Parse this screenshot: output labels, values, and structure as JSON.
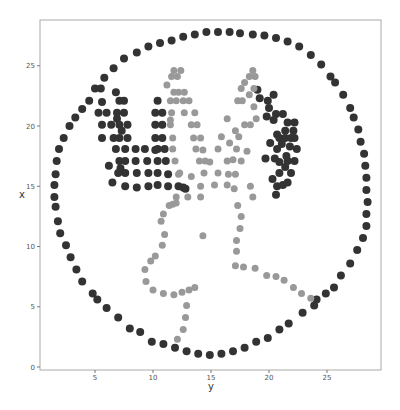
{
  "chart_data": {
    "type": "scatter",
    "title": "",
    "xlabel": "y",
    "ylabel": "x",
    "xlim": [
      0.2,
      29.6
    ],
    "ylim": [
      -0.3,
      28.7
    ],
    "xticks": [
      5,
      10,
      15,
      20,
      25
    ],
    "yticks": [
      0,
      5,
      10,
      15,
      20,
      25
    ],
    "grid": false,
    "legend": null,
    "series": [
      {
        "name": "outer-circle-and-antlers",
        "color": "#333333",
        "marker_size": 8,
        "points": [
          [
            1.6,
            13.3
          ],
          [
            1.8,
            12.1
          ],
          [
            2.0,
            11.1
          ],
          [
            2.5,
            10.1
          ],
          [
            2.9,
            9.1
          ],
          [
            3.4,
            8.1
          ],
          [
            3.9,
            7.1
          ],
          [
            4.8,
            6.1
          ],
          [
            5.2,
            5.6
          ],
          [
            6.0,
            4.9
          ],
          [
            7.0,
            4.1
          ],
          [
            8.0,
            3.2
          ],
          [
            8.9,
            2.9
          ],
          [
            9.9,
            2.1
          ],
          [
            10.9,
            1.9
          ],
          [
            11.9,
            1.6
          ],
          [
            12.9,
            1.3
          ],
          [
            13.9,
            1.1
          ],
          [
            14.9,
            1.0
          ],
          [
            15.9,
            1.1
          ],
          [
            16.9,
            1.3
          ],
          [
            17.9,
            1.6
          ],
          [
            18.9,
            2.1
          ],
          [
            19.9,
            2.4
          ],
          [
            20.9,
            3.1
          ],
          [
            21.7,
            3.6
          ],
          [
            22.9,
            4.5
          ],
          [
            23.9,
            5.1
          ],
          [
            24.1,
            5.6
          ],
          [
            24.9,
            6.1
          ],
          [
            25.6,
            6.6
          ],
          [
            26.2,
            7.6
          ],
          [
            27.0,
            8.6
          ],
          [
            27.6,
            9.7
          ],
          [
            28.1,
            10.7
          ],
          [
            28.4,
            11.7
          ],
          [
            28.4,
            12.7
          ],
          [
            28.5,
            13.7
          ],
          [
            28.4,
            14.7
          ],
          [
            28.4,
            15.7
          ],
          [
            28.3,
            16.7
          ],
          [
            28.2,
            17.7
          ],
          [
            27.9,
            18.7
          ],
          [
            27.7,
            19.7
          ],
          [
            27.3,
            20.7
          ],
          [
            27.0,
            21.5
          ],
          [
            26.4,
            22.6
          ],
          [
            25.7,
            23.6
          ],
          [
            25.3,
            24.1
          ],
          [
            24.5,
            25.1
          ],
          [
            23.6,
            25.9
          ],
          [
            22.6,
            26.6
          ],
          [
            21.6,
            27.0
          ],
          [
            20.6,
            27.3
          ],
          [
            19.6,
            27.5
          ],
          [
            18.6,
            27.6
          ],
          [
            17.5,
            27.7
          ],
          [
            16.6,
            27.8
          ],
          [
            15.6,
            27.8
          ],
          [
            14.6,
            27.8
          ],
          [
            13.6,
            27.6
          ],
          [
            12.6,
            27.4
          ],
          [
            11.6,
            27.1
          ],
          [
            10.6,
            26.9
          ],
          [
            9.6,
            26.6
          ],
          [
            8.6,
            26.1
          ],
          [
            7.5,
            25.6
          ],
          [
            6.6,
            24.8
          ],
          [
            5.8,
            24.0
          ],
          [
            5.0,
            23.1
          ],
          [
            4.5,
            22.1
          ],
          [
            3.9,
            21.4
          ],
          [
            3.3,
            20.7
          ],
          [
            2.8,
            20.0
          ],
          [
            2.3,
            19.0
          ],
          [
            1.9,
            18.1
          ],
          [
            1.7,
            17.1
          ],
          [
            1.6,
            16.0
          ],
          [
            1.5,
            15.1
          ],
          [
            1.5,
            14.1
          ],
          [
            5.6,
            22.0
          ],
          [
            5.3,
            21.1
          ],
          [
            5.5,
            23.1
          ],
          [
            6.0,
            21.1
          ],
          [
            5.6,
            20.1
          ],
          [
            6.4,
            20.1
          ],
          [
            6.9,
            20.6
          ],
          [
            7.1,
            20.1
          ],
          [
            5.6,
            19.0
          ],
          [
            6.6,
            19.0
          ],
          [
            7.1,
            19.0
          ],
          [
            7.8,
            19.0
          ],
          [
            6.8,
            18.1
          ],
          [
            7.6,
            18.1
          ],
          [
            8.5,
            18.1
          ],
          [
            9.3,
            18.1
          ],
          [
            10.4,
            18.1
          ],
          [
            11.0,
            18.1
          ],
          [
            6.2,
            16.7
          ],
          [
            7.1,
            17.1
          ],
          [
            7.6,
            17.1
          ],
          [
            8.5,
            17.1
          ],
          [
            9.5,
            17.1
          ],
          [
            10.4,
            17.1
          ],
          [
            11.1,
            17.1
          ],
          [
            7.2,
            16.5
          ],
          [
            7.0,
            16.1
          ],
          [
            7.6,
            16.1
          ],
          [
            8.6,
            16.1
          ],
          [
            9.6,
            16.1
          ],
          [
            10.4,
            16.1
          ],
          [
            11.3,
            16.0
          ],
          [
            6.5,
            15.3
          ],
          [
            7.6,
            15.0
          ],
          [
            8.6,
            14.9
          ],
          [
            9.6,
            15.0
          ],
          [
            10.4,
            15.1
          ],
          [
            11.3,
            15.0
          ],
          [
            12.2,
            15.0
          ],
          [
            12.6,
            14.9
          ],
          [
            6.8,
            22.8
          ],
          [
            6.9,
            21.1
          ],
          [
            7.1,
            22.1
          ],
          [
            7.5,
            21.1
          ],
          [
            7.5,
            22.1
          ],
          [
            7.8,
            20.1
          ],
          [
            7.3,
            19.6
          ],
          [
            10.4,
            22.1
          ],
          [
            10.2,
            21.1
          ],
          [
            10.8,
            21.1
          ],
          [
            10.2,
            20.1
          ],
          [
            10.8,
            20.1
          ],
          [
            10.2,
            19.0
          ],
          [
            10.8,
            19.0
          ],
          [
            10.2,
            18.0
          ],
          [
            19.0,
            23.0
          ],
          [
            19.2,
            22.3
          ],
          [
            19.9,
            22.1
          ],
          [
            20.4,
            22.6
          ],
          [
            20.0,
            21.5
          ],
          [
            20.6,
            21.0
          ],
          [
            21.2,
            21.0
          ],
          [
            21.6,
            20.3
          ],
          [
            22.2,
            20.3
          ],
          [
            21.4,
            19.6
          ],
          [
            22.1,
            19.6
          ],
          [
            20.4,
            20.5
          ],
          [
            19.8,
            20.8
          ],
          [
            20.7,
            19.3
          ],
          [
            20.9,
            19.0
          ],
          [
            21.4,
            19.0
          ],
          [
            21.9,
            19.0
          ],
          [
            22.2,
            19.0
          ],
          [
            21.1,
            18.5
          ],
          [
            21.8,
            18.3
          ],
          [
            22.4,
            18.1
          ],
          [
            21.5,
            17.5
          ],
          [
            21.6,
            17.1
          ],
          [
            22.2,
            17.1
          ],
          [
            20.1,
            18.6
          ],
          [
            20.7,
            18.1
          ],
          [
            19.7,
            17.3
          ],
          [
            20.5,
            17.3
          ],
          [
            20.9,
            17.0
          ],
          [
            20.9,
            16.1
          ],
          [
            21.4,
            16.6
          ],
          [
            21.9,
            16.1
          ],
          [
            20.3,
            15.6
          ],
          [
            20.7,
            15.0
          ],
          [
            21.2,
            15.1
          ],
          [
            20.6,
            14.3
          ],
          [
            21.6,
            15.3
          ],
          [
            12.8,
            14.8
          ]
        ]
      },
      {
        "name": "inner-figure",
        "color": "#999999",
        "marker_size": 7,
        "points": [
          [
            11.2,
            23.4
          ],
          [
            11.6,
            24.1
          ],
          [
            11.8,
            24.6
          ],
          [
            12.1,
            24.1
          ],
          [
            12.4,
            24.6
          ],
          [
            11.8,
            22.8
          ],
          [
            12.2,
            22.8
          ],
          [
            12.7,
            22.8
          ],
          [
            12.0,
            22.1
          ],
          [
            12.6,
            22.1
          ],
          [
            12.7,
            21.1
          ],
          [
            13.1,
            22.1
          ],
          [
            13.3,
            20.1
          ],
          [
            13.6,
            21.1
          ],
          [
            13.5,
            19.0
          ],
          [
            13.8,
            20.1
          ],
          [
            13.7,
            18.1
          ],
          [
            14.1,
            19.0
          ],
          [
            14.0,
            17.1
          ],
          [
            14.3,
            18.0
          ],
          [
            14.4,
            16.1
          ],
          [
            14.5,
            17.1
          ],
          [
            14.1,
            15.0
          ],
          [
            13.3,
            15.8
          ],
          [
            14.1,
            14.1
          ],
          [
            13.0,
            14.1
          ],
          [
            12.0,
            14.1
          ],
          [
            11.5,
            20.1
          ],
          [
            11.7,
            19.0
          ],
          [
            11.7,
            18.1
          ],
          [
            11.9,
            17.1
          ],
          [
            12.2,
            16.0
          ],
          [
            12.3,
            16.1
          ],
          [
            11.6,
            21.1
          ],
          [
            11.5,
            22.1
          ],
          [
            11.5,
            20.5
          ],
          [
            18.6,
            24.6
          ],
          [
            18.3,
            24.1
          ],
          [
            18.8,
            24.1
          ],
          [
            17.9,
            23.6
          ],
          [
            17.6,
            23.1
          ],
          [
            18.3,
            22.6
          ],
          [
            18.7,
            23.1
          ],
          [
            17.3,
            22.1
          ],
          [
            17.7,
            22.1
          ],
          [
            18.7,
            21.6
          ],
          [
            16.4,
            20.6
          ],
          [
            17.1,
            19.6
          ],
          [
            17.9,
            20.1
          ],
          [
            18.4,
            20.1
          ],
          [
            15.9,
            19.1
          ],
          [
            16.6,
            18.6
          ],
          [
            17.2,
            18.1
          ],
          [
            18.1,
            17.9
          ],
          [
            15.6,
            18.1
          ],
          [
            16.4,
            17.1
          ],
          [
            16.9,
            17.2
          ],
          [
            17.6,
            17.1
          ],
          [
            14.9,
            17.0
          ],
          [
            15.6,
            16.1
          ],
          [
            16.5,
            16.0
          ],
          [
            17.1,
            16.0
          ],
          [
            15.3,
            15.1
          ],
          [
            16.4,
            15.1
          ],
          [
            17.0,
            14.8
          ],
          [
            18.4,
            15.0
          ],
          [
            18.6,
            14.1
          ],
          [
            18.9,
            20.6
          ],
          [
            17.4,
            19.1
          ],
          [
            12.0,
            13.6
          ],
          [
            11.4,
            13.4
          ],
          [
            11.7,
            13.5
          ],
          [
            10.9,
            12.7
          ],
          [
            10.7,
            12.1
          ],
          [
            11.0,
            11.0
          ],
          [
            10.8,
            10.1
          ],
          [
            10.2,
            9.2
          ],
          [
            9.8,
            8.8
          ],
          [
            9.3,
            8.1
          ],
          [
            9.4,
            7.1
          ],
          [
            10.0,
            6.4
          ],
          [
            10.9,
            6.1
          ],
          [
            11.8,
            6.0
          ],
          [
            12.5,
            6.2
          ],
          [
            13.1,
            6.4
          ],
          [
            13.6,
            6.6
          ],
          [
            12.9,
            5.1
          ],
          [
            12.8,
            4.1
          ],
          [
            12.6,
            3.1
          ],
          [
            12.1,
            2.3
          ],
          [
            14.3,
            10.9
          ],
          [
            17.3,
            13.4
          ],
          [
            17.6,
            12.5
          ],
          [
            17.5,
            11.5
          ],
          [
            17.2,
            10.5
          ],
          [
            17.2,
            9.6
          ],
          [
            17.1,
            8.4
          ],
          [
            17.8,
            8.3
          ],
          [
            18.8,
            8.2
          ],
          [
            19.8,
            7.6
          ],
          [
            20.6,
            7.5
          ],
          [
            21.3,
            7.2
          ],
          [
            22.1,
            6.6
          ],
          [
            22.8,
            6.1
          ],
          [
            23.6,
            5.7
          ]
        ]
      }
    ]
  }
}
